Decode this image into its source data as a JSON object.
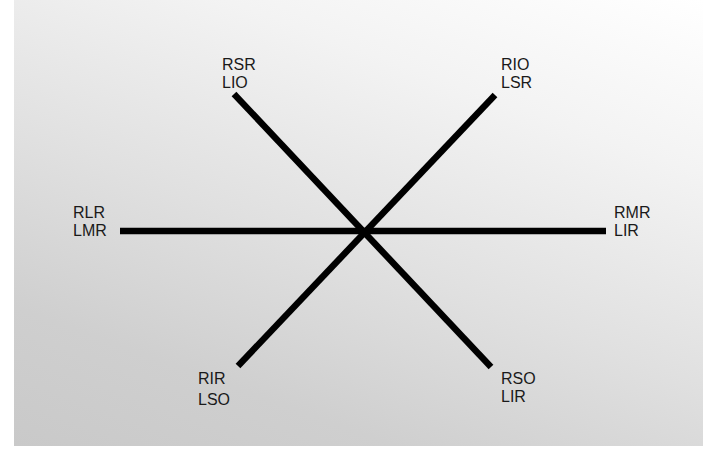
{
  "diagram": {
    "type": "six-direction cross (diagnostic gaze positions)",
    "line_color": "#000000",
    "background_gradient": [
      "#ffffff",
      "#c9c9c9"
    ],
    "positions": [
      {
        "id": "up-right-of-viewer-left",
        "top": "RSR",
        "bottom": "LIO"
      },
      {
        "id": "up-left-of-viewer-right",
        "top": "RIO",
        "bottom": "LSR"
      },
      {
        "id": "left",
        "top": "RLR",
        "bottom": "LMR"
      },
      {
        "id": "right",
        "top": "RMR",
        "bottom": "LIR"
      },
      {
        "id": "down-left",
        "top": "RIR",
        "bottom": "LSO"
      },
      {
        "id": "down-right",
        "top": "RSO",
        "bottom": "LIR"
      }
    ],
    "lines": [
      {
        "name": "horizontal-line",
        "x1": 106,
        "y1": 231,
        "x2": 592,
        "y2": 231
      },
      {
        "name": "diagonal-nw-se-line",
        "x1": 220,
        "y1": 94,
        "x2": 477,
        "y2": 367
      },
      {
        "name": "diagonal-ne-sw-line",
        "x1": 481,
        "y1": 95,
        "x2": 224,
        "y2": 366
      }
    ]
  }
}
